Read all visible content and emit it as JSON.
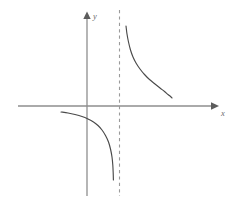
{
  "figure": {
    "background_color": "#ffffff",
    "width": 242,
    "height": 204,
    "axis_color": "#8e8e8e",
    "curve_color": "#4a4a4a",
    "asymptote_color": "#9a9a9a",
    "label_color": "#6b6b6b"
  },
  "axes": {
    "x_label": "x",
    "y_label": "y",
    "x_axis_name": "horizontal-axis",
    "y_axis_name": "vertical-axis",
    "origin_px": {
      "x": 87,
      "y": 106
    },
    "x_axis_span_px": {
      "from": 18,
      "to": 216
    },
    "y_axis_span_px": {
      "from": 13,
      "to": 196
    },
    "ticks": [],
    "tick_labels": [],
    "grid": false
  },
  "icons": {
    "x_arrow": "arrow-right-icon",
    "y_arrow": "arrow-up-icon"
  },
  "chart_data": {
    "type": "line",
    "title": "",
    "subtitle": "",
    "xlabel": "x",
    "ylabel": "y",
    "grid": false,
    "legend": null,
    "legend_position": "none",
    "xlim": [
      -3.2,
      4.3
    ],
    "ylim": [
      -3.0,
      3.0
    ],
    "annotations": [
      {
        "name": "vertical-asymptote",
        "kind": "vertical-dashed-line",
        "x": 1.0,
        "style": "dashed",
        "label": "",
        "pixel_x": 119,
        "pixel_y_from": 10,
        "pixel_y_to": 196
      }
    ],
    "series": [
      {
        "name": "upper-right-branch",
        "description": "decreasing convex branch in the region right of the vertical asymptote, approaching the asymptote upward and the x-axis from above",
        "points_px": [
          [
            126,
            26
          ],
          [
            127,
            34
          ],
          [
            128.5,
            42
          ],
          [
            130.5,
            50
          ],
          [
            133,
            57
          ],
          [
            136,
            63
          ],
          [
            140,
            69
          ],
          [
            144.5,
            74.5
          ],
          [
            149.5,
            79.5
          ],
          [
            155,
            84
          ],
          [
            160,
            88
          ],
          [
            164.5,
            91.5
          ],
          [
            168,
            94.5
          ],
          [
            170.5,
            96.5
          ],
          [
            172,
            98
          ]
        ],
        "values": [
          {
            "x": 1.18,
            "y": 2.6
          },
          {
            "x": 1.25,
            "y": 2.05
          },
          {
            "x": 1.36,
            "y": 1.6
          },
          {
            "x": 1.52,
            "y": 1.28
          },
          {
            "x": 1.72,
            "y": 1.05
          },
          {
            "x": 1.96,
            "y": 0.88
          },
          {
            "x": 2.25,
            "y": 0.74
          },
          {
            "x": 2.55,
            "y": 0.63
          },
          {
            "x": 2.9,
            "y": 0.54
          },
          {
            "x": 3.25,
            "y": 0.46
          },
          {
            "x": 3.6,
            "y": 0.4
          },
          {
            "x": 3.9,
            "y": 0.35
          },
          {
            "x": 4.1,
            "y": 0.3
          },
          {
            "x": 4.25,
            "y": 0.26
          },
          {
            "x": 4.35,
            "y": 0.22
          }
        ]
      },
      {
        "name": "lower-left-branch",
        "description": "decreasing concave branch in the region left of the vertical asymptote, approaching the x-axis from below on the left and falling toward the asymptote",
        "points_px": [
          [
            61,
            112
          ],
          [
            68,
            113
          ],
          [
            75,
            114.5
          ],
          [
            82,
            116.5
          ],
          [
            88,
            119
          ],
          [
            93.5,
            122
          ],
          [
            98,
            125.5
          ],
          [
            102,
            130
          ],
          [
            105.5,
            135.5
          ],
          [
            108.5,
            142
          ],
          [
            110.5,
            149
          ],
          [
            112,
            157
          ],
          [
            112.8,
            165
          ],
          [
            113.2,
            173
          ],
          [
            113.4,
            180
          ]
        ],
        "values": [
          {
            "x": -1.75,
            "y": -0.13
          },
          {
            "x": -1.3,
            "y": -0.18
          },
          {
            "x": -0.82,
            "y": -0.24
          },
          {
            "x": -0.35,
            "y": -0.32
          },
          {
            "x": 0.06,
            "y": -0.41
          },
          {
            "x": 0.43,
            "y": -0.51
          },
          {
            "x": 0.73,
            "y": -0.63
          },
          {
            "x": 1.0,
            "y": -0.78
          },
          {
            "x": 1.24,
            "y": -0.96
          },
          {
            "x": 1.44,
            "y": -1.17
          },
          {
            "x": 1.58,
            "y": -1.41
          },
          {
            "x": 1.68,
            "y": -1.67
          },
          {
            "x": 1.73,
            "y": -1.94
          },
          {
            "x": 1.76,
            "y": -2.21
          },
          {
            "x": 1.77,
            "y": -2.44
          }
        ]
      }
    ]
  }
}
